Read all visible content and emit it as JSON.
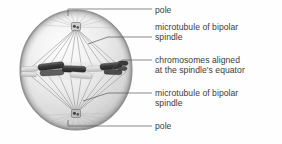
{
  "figure": {
    "background_color": "#fefefe",
    "text_color": "#3b3b3b",
    "leader_line_color": "#5a5a5a"
  },
  "cell": {
    "shape": "sphere",
    "membrane_color": "#8c8c8c",
    "cytoplasm_color": "#e9e9e9",
    "center_x": 76,
    "center_y": 70,
    "radius_x": 56,
    "radius_y": 60,
    "spindle_fiber_color": "#9a9a9a",
    "chromosome_color": "#3d3d3d",
    "chromatid_light_color": "#d8d8d8",
    "pole_color": "#555555",
    "top_pole_x": 76,
    "top_pole_y": 27,
    "bottom_pole_x": 76,
    "bottom_pole_y": 114,
    "equator_y": 71
  },
  "labels": [
    {
      "id": "pole-top",
      "lines": [
        "pole"
      ],
      "leader": {
        "type": "elbow",
        "anchor_x": 68,
        "anchor_y": 16,
        "bend_x": 68,
        "bend_y": 9,
        "end_x": 152,
        "end_y": 9
      }
    },
    {
      "id": "microtubule-top",
      "lines": [
        "microtubule of bipolar",
        "spindle"
      ],
      "leader": {
        "type": "diagonal",
        "anchor_x": 88,
        "anchor_y": 44,
        "bend_x": 108,
        "bend_y": 37,
        "end_x": 152,
        "end_y": 37
      }
    },
    {
      "id": "chromosomes",
      "lines": [
        "chromosomes aligned",
        "at the spindle's equator"
      ],
      "leader": {
        "type": "diagonal",
        "anchor_x": 112,
        "anchor_y": 69,
        "bend_x": 122,
        "bend_y": 60,
        "end_x": 152,
        "end_y": 60
      }
    },
    {
      "id": "microtubule-bottom",
      "lines": [
        "microtubule of bipolar",
        "spindle"
      ],
      "leader": {
        "type": "diagonal",
        "anchor_x": 83,
        "anchor_y": 101,
        "bend_x": 108,
        "bend_y": 93,
        "end_x": 152,
        "end_y": 93
      }
    },
    {
      "id": "pole-bottom",
      "lines": [
        "pole"
      ],
      "leader": {
        "type": "elbow",
        "anchor_x": 68,
        "anchor_y": 120,
        "bend_x": 68,
        "bend_y": 126,
        "end_x": 152,
        "end_y": 126
      }
    }
  ]
}
